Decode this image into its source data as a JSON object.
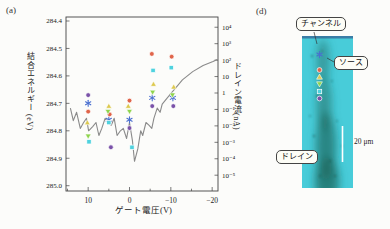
{
  "panel_a": {
    "label": "(a)"
  },
  "panel_d": {
    "label": "(d)",
    "callouts": {
      "channel": "チャンネル",
      "source": "ソース",
      "drain": "ドレイン"
    },
    "scalebar": "20 μm"
  },
  "colors": {
    "curve": "#8a8a8a",
    "micrograph_cyan": "#48ccd9",
    "channel_dark": "#1d6a5f",
    "scalebar": "#ffffff",
    "marker_blue": "#4a6fd0",
    "marker_orange": "#e0654a",
    "marker_yellow": "#ddc94f",
    "marker_green": "#8ed44c",
    "marker_cyan": "#4fd2de",
    "marker_purple": "#7a52a8"
  },
  "chart_data": {
    "type": "scatter",
    "title": "",
    "x_axis": {
      "label": "ゲート電圧(V)",
      "unit": "V",
      "range": [
        15.4,
        -21.4
      ],
      "major_ticks": [
        10,
        0,
        -10,
        -20
      ],
      "major_tick_labels": [
        "10",
        "0",
        "−10",
        "−20"
      ],
      "minor_ticks": [
        15,
        5,
        -5,
        -15
      ]
    },
    "y_left_axis": {
      "label": "結合エネルギー (eV)",
      "unit": "eV",
      "inverted": true,
      "range": [
        284.39,
        285.02
      ],
      "ticks": [
        {
          "value": 284.4,
          "label": "284.4"
        },
        {
          "value": 284.5,
          "label": "284.5"
        },
        {
          "value": 284.6,
          "label": "284.6"
        },
        {
          "value": 284.7,
          "label": "284.7"
        },
        {
          "value": 284.8,
          "label": "284.8"
        },
        {
          "value": 284.9,
          "label": "284.9"
        },
        {
          "value": 285.0,
          "label": "285.0"
        }
      ]
    },
    "y_right_axis": {
      "label": "ドレイン電流(nA)",
      "unit": "nA",
      "scale": "log10",
      "ticks": [
        {
          "exp": 4,
          "label": "10⁴"
        },
        {
          "exp": 3,
          "label": "10³"
        },
        {
          "exp": 2,
          "label": "10²"
        },
        {
          "exp": 1,
          "label": "10"
        },
        {
          "exp": 0,
          "label": "1"
        },
        {
          "exp": -1,
          "label": "10⁻¹"
        },
        {
          "exp": -2,
          "label": "10⁻²"
        },
        {
          "exp": -3,
          "label": "10⁻³"
        },
        {
          "exp": -4,
          "label": "10⁻⁴"
        },
        {
          "exp": -5,
          "label": "10⁻⁵"
        }
      ]
    },
    "series": [
      {
        "name": "star-blue",
        "marker": "asterisk",
        "color": "#4a6fd0",
        "points": [
          [
            10,
            284.7
          ],
          [
            5,
            284.76
          ],
          [
            0,
            284.76
          ],
          [
            -5.5,
            284.68
          ],
          [
            -10.5,
            284.68
          ]
        ]
      },
      {
        "name": "circle-orange",
        "marker": "circle",
        "color": "#e0654a",
        "points": [
          [
            10,
            284.73
          ],
          [
            4.8,
            284.74
          ],
          [
            0,
            284.69
          ],
          [
            -5.4,
            284.52
          ],
          [
            -10.2,
            284.53
          ]
        ]
      },
      {
        "name": "triangle-up-yellow",
        "marker": "triangle-up",
        "color": "#ddc94f",
        "points": [
          [
            10.2,
            284.77
          ],
          [
            5,
            284.71
          ],
          [
            0.3,
            284.71
          ],
          [
            -5.8,
            284.63
          ],
          [
            -10.7,
            284.64
          ]
        ]
      },
      {
        "name": "triangle-down-green",
        "marker": "triangle-down",
        "color": "#8ed44c",
        "points": [
          [
            10,
            284.82
          ],
          [
            5.2,
            284.73
          ],
          [
            0,
            284.73
          ],
          [
            -5.6,
            284.66
          ],
          [
            -10.4,
            284.67
          ]
        ]
      },
      {
        "name": "square-cyan",
        "marker": "square",
        "color": "#4fd2de",
        "points": [
          [
            9.8,
            284.84
          ],
          [
            5,
            284.77
          ],
          [
            -0.6,
            284.86
          ],
          [
            -5.7,
            284.58
          ],
          [
            -10.1,
            284.57
          ]
        ]
      },
      {
        "name": "circle-purple",
        "marker": "circle",
        "color": "#7a52a8",
        "points": [
          [
            10,
            284.67
          ],
          [
            4.5,
            284.86
          ],
          [
            0,
            284.79
          ],
          [
            -5.5,
            284.71
          ],
          [
            -10.6,
            284.71
          ]
        ]
      }
    ],
    "line_series": {
      "name": "drain-current-curve",
      "color": "#8a8a8a",
      "points_v_na": [
        [
          14.3,
          0.12
        ],
        [
          13.6,
          0.021
        ],
        [
          12.8,
          0.067
        ],
        [
          11.9,
          0.007
        ],
        [
          11.1,
          0.016
        ],
        [
          10.4,
          0.029
        ],
        [
          9.9,
          0.005
        ],
        [
          8.9,
          0.009
        ],
        [
          8.1,
          0.016
        ],
        [
          7.4,
          0.0026
        ],
        [
          6.7,
          0.007
        ],
        [
          5.9,
          0.029
        ],
        [
          5.2,
          0.016
        ],
        [
          4.4,
          0.011
        ],
        [
          3.7,
          0.029
        ],
        [
          3.0,
          0.0026
        ],
        [
          2.2,
          0.005
        ],
        [
          1.5,
          0.007
        ],
        [
          0.7,
          0.0017
        ],
        [
          0,
          0.016
        ],
        [
          -0.7,
          0.0013
        ],
        [
          -1.2,
          7e-05
        ],
        [
          -2.0,
          0.0004
        ],
        [
          -2.7,
          0.005
        ],
        [
          -3.2,
          0.0026
        ],
        [
          -4.0,
          0.016
        ],
        [
          -4.7,
          0.011
        ],
        [
          -5.4,
          0.007
        ],
        [
          -5.9,
          0.029
        ],
        [
          -6.7,
          0.12
        ],
        [
          -7.4,
          0.067
        ],
        [
          -7.9,
          0.21
        ],
        [
          -9.1,
          0.49
        ],
        [
          -10.4,
          1.2
        ],
        [
          -11.6,
          2.7
        ],
        [
          -12.8,
          6.3
        ],
        [
          -15.3,
          20
        ],
        [
          -17.8,
          47
        ],
        [
          -20.2,
          81
        ],
        [
          -22,
          110
        ]
      ]
    }
  }
}
